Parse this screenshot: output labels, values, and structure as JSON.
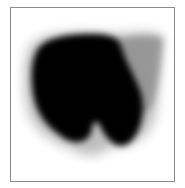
{
  "image": {
    "description": "Grayscale blot image: dark mass with two lower lobes and lighter diffuse region at upper right, inside a thin gray frame",
    "colors": {
      "background": "#ffffff",
      "frame": "#8a8a8a",
      "mass": "#000000",
      "diffuse": "#9a9a9a"
    }
  }
}
